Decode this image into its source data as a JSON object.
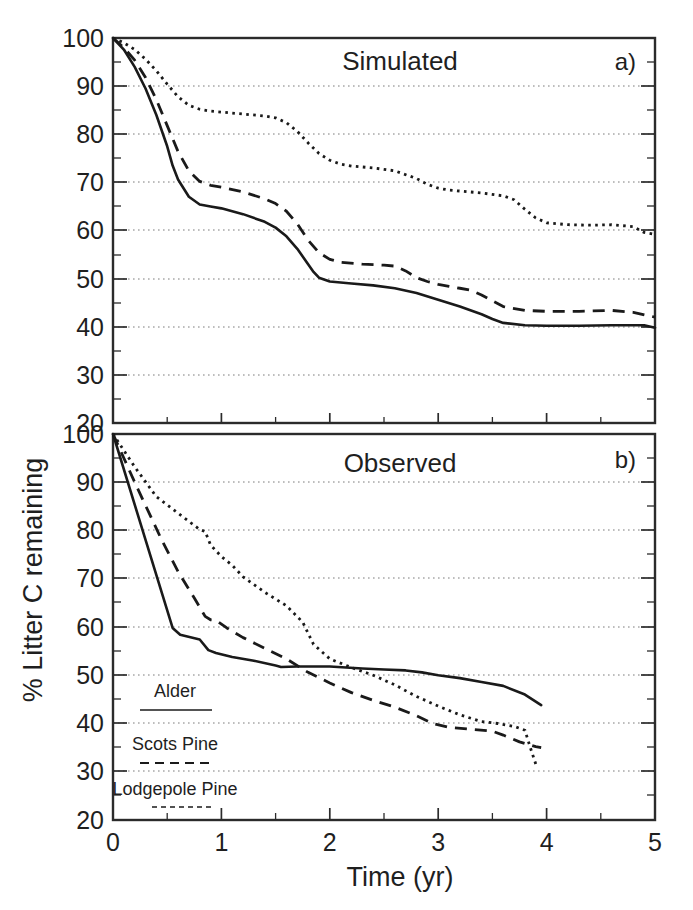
{
  "figure": {
    "y_axis_label": "% Litter C remaining",
    "x_axis_label": "Time (yr)"
  },
  "panels": {
    "a": {
      "letter": "a)",
      "title": "Simulated"
    },
    "b": {
      "letter": "b)",
      "title": "Observed"
    }
  },
  "legend": {
    "items": [
      {
        "label": "Alder",
        "style": "solid"
      },
      {
        "label": "Scots Pine",
        "style": "dashed"
      },
      {
        "label": "Lodgepole Pine",
        "style": "dotted"
      }
    ]
  },
  "axis_ticks": {
    "y": [
      "20",
      "30",
      "40",
      "50",
      "60",
      "70",
      "80",
      "90",
      "100"
    ],
    "x": [
      "0",
      "1",
      "2",
      "3",
      "4",
      "5"
    ]
  },
  "chart_data": [
    {
      "type": "line",
      "id": "panel-a-simulated",
      "title": "Simulated",
      "panel_letter": "a)",
      "xlabel": "Time (yr)",
      "ylabel": "% Litter C remaining",
      "xlim": [
        0,
        5
      ],
      "ylim": [
        20,
        100
      ],
      "xticks": [
        0,
        1,
        2,
        3,
        4,
        5
      ],
      "yticks": [
        20,
        30,
        40,
        50,
        60,
        70,
        80,
        90,
        100
      ],
      "minor_xtick_step": 0.5,
      "minor_ytick_step": 5,
      "grid": "horizontal-dotted",
      "legend_position": "lower-left-of-panel-b",
      "series": [
        {
          "name": "Alder",
          "style": "solid",
          "x": [
            0.0,
            0.1,
            0.2,
            0.3,
            0.4,
            0.5,
            0.55,
            0.6,
            0.7,
            0.8,
            0.9,
            1.0,
            1.2,
            1.4,
            1.5,
            1.6,
            1.7,
            1.8,
            1.85,
            1.9,
            2.0,
            2.2,
            2.4,
            2.6,
            2.8,
            3.0,
            3.2,
            3.4,
            3.5,
            3.6,
            3.8,
            4.0,
            4.3,
            4.6,
            4.9,
            5.0
          ],
          "y": [
            100.0,
            97.6,
            94.0,
            89.5,
            84.0,
            77.5,
            73.5,
            70.6,
            67.0,
            65.4,
            65.0,
            64.6,
            63.4,
            61.8,
            60.6,
            58.8,
            56.2,
            53.0,
            51.4,
            50.2,
            49.4,
            49.0,
            48.6,
            48.0,
            47.0,
            45.6,
            44.2,
            42.6,
            41.6,
            40.8,
            40.3,
            40.2,
            40.2,
            40.3,
            40.3,
            39.8
          ]
        },
        {
          "name": "Scots Pine",
          "style": "dashed",
          "x": [
            0.0,
            0.1,
            0.2,
            0.3,
            0.4,
            0.5,
            0.6,
            0.7,
            0.8,
            0.9,
            1.0,
            1.2,
            1.4,
            1.5,
            1.6,
            1.7,
            1.8,
            1.9,
            2.0,
            2.1,
            2.3,
            2.5,
            2.6,
            2.7,
            2.8,
            2.9,
            3.0,
            3.1,
            3.2,
            3.3,
            3.4,
            3.6,
            3.8,
            4.0,
            4.3,
            4.6,
            4.8,
            5.0
          ],
          "y": [
            100.0,
            98.0,
            95.4,
            91.8,
            87.2,
            81.8,
            76.4,
            72.4,
            70.2,
            69.4,
            69.0,
            68.0,
            66.6,
            65.6,
            64.0,
            61.4,
            58.0,
            55.4,
            54.0,
            53.4,
            53.0,
            52.8,
            52.6,
            51.6,
            50.2,
            49.4,
            48.8,
            48.4,
            48.0,
            47.6,
            46.6,
            44.2,
            43.4,
            43.2,
            43.2,
            43.4,
            43.0,
            42.0
          ]
        },
        {
          "name": "Lodgepole Pine",
          "style": "dotted",
          "x": [
            0.0,
            0.1,
            0.2,
            0.3,
            0.4,
            0.5,
            0.6,
            0.7,
            0.8,
            0.9,
            1.0,
            1.2,
            1.4,
            1.5,
            1.6,
            1.7,
            1.8,
            1.9,
            2.0,
            2.1,
            2.2,
            2.4,
            2.6,
            2.8,
            2.9,
            3.0,
            3.1,
            3.2,
            3.4,
            3.6,
            3.7,
            3.8,
            3.9,
            4.0,
            4.2,
            4.4,
            4.6,
            4.8,
            4.9,
            5.0
          ],
          "y": [
            100.0,
            99.0,
            97.6,
            95.6,
            93.2,
            90.4,
            87.8,
            86.0,
            85.2,
            84.8,
            84.6,
            84.2,
            83.8,
            83.4,
            82.4,
            80.6,
            78.2,
            76.0,
            74.6,
            73.8,
            73.4,
            73.0,
            72.4,
            70.8,
            69.6,
            68.8,
            68.4,
            68.2,
            67.8,
            67.2,
            66.4,
            64.4,
            62.6,
            61.6,
            61.2,
            61.1,
            61.2,
            60.8,
            59.6,
            59.2
          ]
        }
      ]
    },
    {
      "type": "line",
      "id": "panel-b-observed",
      "title": "Observed",
      "panel_letter": "b)",
      "xlabel": "Time (yr)",
      "ylabel": "% Litter C remaining",
      "xlim": [
        0,
        5
      ],
      "ylim": [
        20,
        100
      ],
      "xticks": [
        0,
        1,
        2,
        3,
        4,
        5
      ],
      "yticks": [
        20,
        30,
        40,
        50,
        60,
        70,
        80,
        90,
        100
      ],
      "minor_xtick_step": 0.5,
      "minor_ytick_step": 5,
      "grid": "horizontal-dotted",
      "legend_position": "lower-left",
      "series": [
        {
          "name": "Alder",
          "style": "solid",
          "x": [
            0.0,
            0.55,
            0.62,
            0.8,
            0.88,
            0.95,
            1.1,
            1.3,
            1.5,
            1.55,
            1.7,
            2.0,
            2.3,
            2.5,
            2.7,
            2.85,
            3.0,
            3.2,
            3.4,
            3.6,
            3.8,
            3.95
          ],
          "y": [
            102.0,
            59.8,
            58.4,
            57.4,
            55.2,
            54.6,
            53.8,
            53.0,
            52.0,
            51.7,
            51.8,
            51.8,
            51.4,
            51.2,
            51.0,
            50.6,
            50.0,
            49.4,
            48.6,
            47.8,
            46.0,
            43.8
          ]
        },
        {
          "name": "Scots Pine",
          "style": "dashed",
          "x": [
            0.0,
            0.2,
            0.45,
            0.6,
            0.75,
            0.85,
            0.9,
            0.95,
            1.05,
            1.2,
            1.4,
            1.6,
            1.8,
            2.0,
            2.2,
            2.4,
            2.6,
            2.8,
            2.95,
            3.1,
            3.3,
            3.5,
            3.6,
            3.75,
            3.9,
            3.95
          ],
          "y": [
            102.0,
            90.0,
            78.0,
            71.5,
            66.0,
            62.2,
            61.5,
            61.4,
            59.8,
            57.8,
            55.6,
            53.4,
            50.6,
            48.4,
            46.4,
            44.8,
            43.4,
            41.6,
            40.0,
            39.2,
            38.8,
            38.4,
            37.6,
            36.2,
            35.2,
            35.0
          ]
        },
        {
          "name": "Lodgepole Pine",
          "style": "dotted",
          "x": [
            0.0,
            0.2,
            0.4,
            0.6,
            0.8,
            0.85,
            0.9,
            1.0,
            1.1,
            1.2,
            1.4,
            1.6,
            1.75,
            1.85,
            2.0,
            2.2,
            2.4,
            2.6,
            2.8,
            3.0,
            3.2,
            3.4,
            3.55,
            3.7,
            3.8,
            3.85,
            3.9
          ],
          "y": [
            102.0,
            93.2,
            87.0,
            83.6,
            80.2,
            79.8,
            77.0,
            74.6,
            72.8,
            70.4,
            67.2,
            64.4,
            61.0,
            56.4,
            53.4,
            51.6,
            50.0,
            48.0,
            45.6,
            43.6,
            41.8,
            40.4,
            40.0,
            39.4,
            38.6,
            35.0,
            31.6
          ]
        }
      ]
    }
  ]
}
